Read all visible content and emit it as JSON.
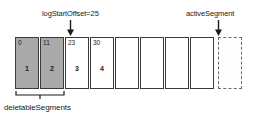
{
  "diagram": {
    "annotations": {
      "log_start_offset": "logStartOffset=25",
      "active_segment": "activeSegment",
      "deletable_segments": "deletableSegments"
    },
    "colors": {
      "shaded_fill": "#a9a9a9",
      "empty_fill": "#ffffff",
      "stroke": "#3b3b3b",
      "dashed_stroke": "#6a6a6a",
      "text": "#1a1a1a"
    },
    "segments": [
      {
        "offset": "0",
        "index": "1",
        "shaded": true,
        "dashed": false
      },
      {
        "offset": "11",
        "index": "2",
        "shaded": true,
        "dashed": false
      },
      {
        "offset": "23",
        "index": "3",
        "shaded": false,
        "dashed": false
      },
      {
        "offset": "30",
        "index": "4",
        "shaded": false,
        "dashed": false
      },
      {
        "offset": "",
        "index": "",
        "shaded": false,
        "dashed": false
      },
      {
        "offset": "",
        "index": "",
        "shaded": false,
        "dashed": false
      },
      {
        "offset": "",
        "index": "",
        "shaded": false,
        "dashed": false
      },
      {
        "offset": "",
        "index": "",
        "shaded": false,
        "dashed": false
      },
      {
        "offset": "",
        "index": "",
        "shaded": false,
        "dashed": true
      }
    ]
  }
}
